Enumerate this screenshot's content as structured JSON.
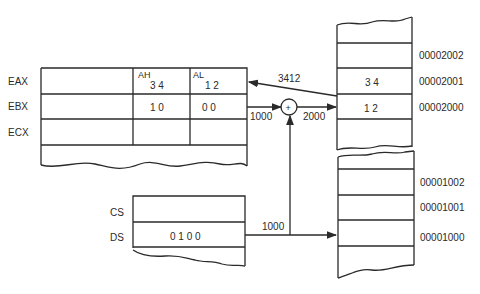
{
  "registers": {
    "labels": [
      "EAX",
      "EBX",
      "ECX"
    ],
    "eax": {
      "ah_label": "AH",
      "ah_value": "3 4",
      "al_label": "AL",
      "al_value": "1 2"
    },
    "ebx": {
      "high_value": "1 0",
      "low_value": "0 0"
    }
  },
  "segments": {
    "labels": [
      "CS",
      "DS"
    ],
    "ds_value": "0 1 0 0"
  },
  "adder": {
    "symbol": "+",
    "input_label": "1000",
    "output_label": "2000"
  },
  "arrows": {
    "loaded_value": "3412",
    "segment_base": "1000"
  },
  "memory_upper": {
    "addresses": [
      "00002002",
      "00002001",
      "00002000"
    ],
    "values": [
      "",
      "3 4",
      "1 2"
    ]
  },
  "memory_lower": {
    "addresses": [
      "00001002",
      "00001001",
      "00001000"
    ],
    "values": [
      "",
      "",
      ""
    ]
  },
  "colors": {
    "line": "#2a2a2a",
    "background": "#ffffff"
  }
}
